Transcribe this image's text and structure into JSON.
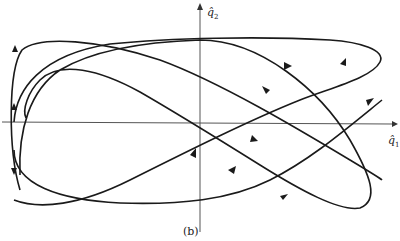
{
  "figure": {
    "caption": "(b)",
    "axes": {
      "x_label": "q̂",
      "x_subscript": "1",
      "y_label": "q̂",
      "y_subscript": "2"
    },
    "colors": {
      "curve": "#1a1a1a",
      "axis": "#555555",
      "background": "#ffffff"
    }
  }
}
